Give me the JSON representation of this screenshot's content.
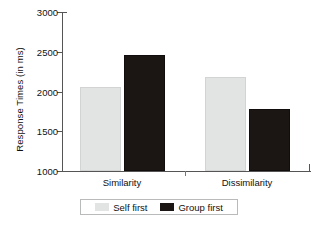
{
  "chart_data": {
    "type": "bar",
    "title": "",
    "xlabel": "",
    "ylabel": "Response Times (in ms)",
    "categories": [
      "Similarity",
      "Dissimilarity"
    ],
    "series": [
      {
        "name": "Self first",
        "color": "#e2e4e3",
        "values": [
          2060,
          2180
        ]
      },
      {
        "name": "Group first",
        "color": "#1b1614",
        "values": [
          2460,
          1780
        ]
      }
    ],
    "ylim": [
      1000,
      3000
    ],
    "yticks": [
      1000,
      1500,
      2000,
      2500,
      3000
    ],
    "ytick_labels": [
      "1000",
      "1500",
      "2000",
      "2500",
      "3000"
    ],
    "grid": false,
    "legend_position": "bottom"
  },
  "legend": {
    "items": [
      {
        "label": "Self first",
        "swatch": "light-gray-swatch"
      },
      {
        "label": "Group first",
        "swatch": "black-swatch"
      }
    ]
  }
}
